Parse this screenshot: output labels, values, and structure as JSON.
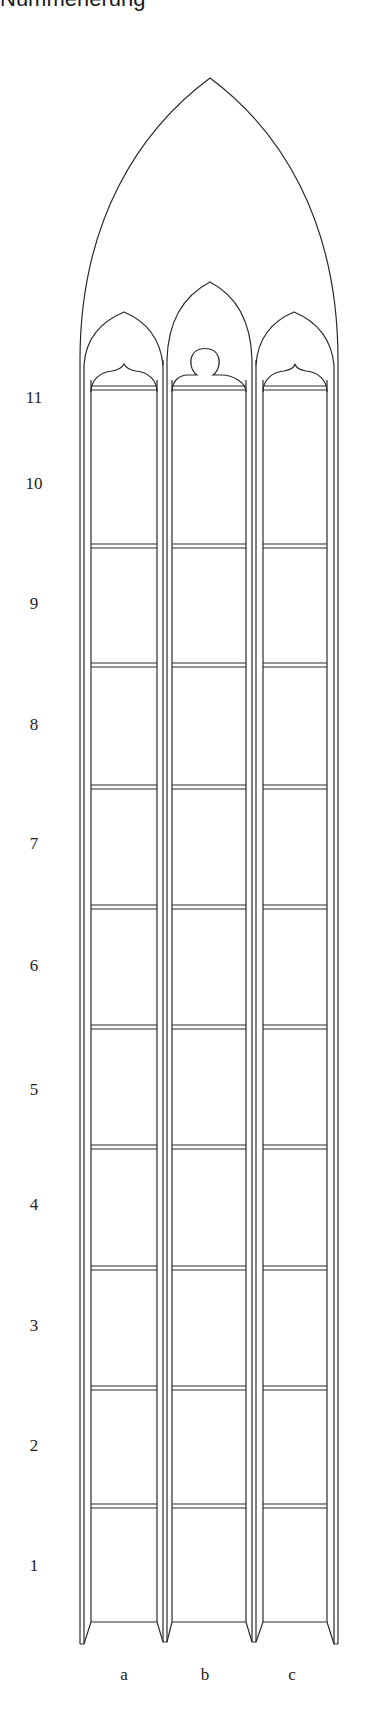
{
  "title": "Nummerierung",
  "rows": [
    {
      "label": "11",
      "y": 398
    },
    {
      "label": "10",
      "y": 484
    },
    {
      "label": "9",
      "y": 604
    },
    {
      "label": "8",
      "y": 725
    },
    {
      "label": "7",
      "y": 844
    },
    {
      "label": "6",
      "y": 966
    },
    {
      "label": "5",
      "y": 1090
    },
    {
      "label": "4",
      "y": 1205
    },
    {
      "label": "3",
      "y": 1326
    },
    {
      "label": "2",
      "y": 1446
    },
    {
      "label": "1",
      "y": 1566
    }
  ],
  "columns": [
    {
      "label": "a",
      "x": 124
    },
    {
      "label": "b",
      "x": 205
    },
    {
      "label": "c",
      "x": 292
    }
  ],
  "colors": {
    "line": "#2a2a2a",
    "background": "#ffffff"
  }
}
